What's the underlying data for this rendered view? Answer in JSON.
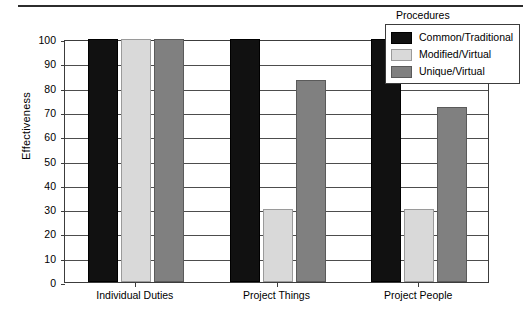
{
  "chart_data": {
    "type": "bar",
    "title": "",
    "xlabel": "",
    "ylabel": "Effectiveness",
    "categories": [
      "Individual Duties",
      "Project Things",
      "Project People"
    ],
    "series": [
      {
        "name": "Common/Traditional",
        "color": "#111111",
        "values": [
          100,
          100,
          100
        ]
      },
      {
        "name": "Modified/Virtual",
        "color": "#d9d9d9",
        "values": [
          100,
          30,
          30
        ]
      },
      {
        "name": "Unique/Virtual",
        "color": "#808080",
        "values": [
          100,
          83,
          72
        ]
      }
    ],
    "ylim": [
      0,
      100
    ],
    "ytick_step": 10,
    "yticks": [
      100,
      90,
      80,
      70,
      60,
      50,
      40,
      30,
      20,
      10,
      0
    ],
    "grid": true,
    "legend": {
      "title": "Procedures",
      "position": "top-right",
      "entries": [
        "Common/Traditional",
        "Modified/Virtual",
        "Unique/Virtual"
      ]
    }
  }
}
